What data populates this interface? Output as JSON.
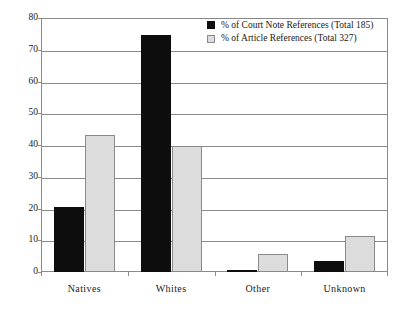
{
  "chart_data": {
    "type": "bar",
    "title": "",
    "subtitle": "",
    "xlabel": "",
    "ylabel": "",
    "categories": [
      "Natives",
      "Whites",
      "Other",
      "Unknown"
    ],
    "series": [
      {
        "name": "% of Court Note References (Total 185)",
        "color": "#0d0d0d",
        "values": [
          20.5,
          74.5,
          0.6,
          3.5
        ]
      },
      {
        "name": "% of Article References (Total 327)",
        "color": "#dcdcdc",
        "values": [
          43.0,
          39.7,
          5.6,
          11.3
        ]
      }
    ],
    "ylim": [
      0,
      80
    ],
    "yticks": [
      0,
      10,
      20,
      30,
      40,
      50,
      60,
      70,
      80
    ],
    "ytick_labels": [
      "0",
      "10",
      "20",
      "30",
      "40",
      "50",
      "60",
      "70",
      "80"
    ],
    "grid": true,
    "grid_axis": "y",
    "legend_position": "top-right",
    "legend": [
      "% of Court Note References (Total 185)",
      "% of Article References (Total 327)"
    ]
  },
  "colors": {
    "series_dark": "#0d0d0d",
    "series_light": "#dcdcdc",
    "axis": "#8a8a8a",
    "text": "#1a1a1a",
    "background": "#ffffff"
  }
}
